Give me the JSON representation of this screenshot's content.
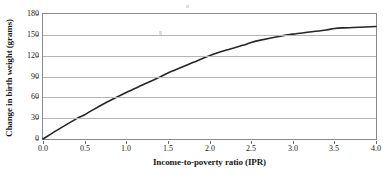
{
  "chart_data": {
    "type": "line",
    "title": "",
    "subtitle": "",
    "xlabel": "Income-to-poverty ratio (IPR)",
    "ylabel": "Change in birth weight (grams)",
    "xlim": [
      0.0,
      4.0
    ],
    "ylim": [
      0,
      180
    ],
    "xticks": [
      "0.0",
      "0.5",
      "1.0",
      "1.5",
      "2.0",
      "2.5",
      "3.0",
      "3.5",
      "4.0"
    ],
    "xtick_values": [
      0.0,
      0.5,
      1.0,
      1.5,
      2.0,
      2.5,
      3.0,
      3.5,
      4.0
    ],
    "yticks": [
      "0",
      "30",
      "60",
      "90",
      "120",
      "150",
      "180"
    ],
    "ytick_values": [
      0,
      30,
      60,
      90,
      120,
      150,
      180
    ],
    "grid": "horizontal",
    "legend": "none",
    "annotations": [],
    "series": [
      {
        "name": "Change in birth weight",
        "color": "#262626",
        "x": [
          0.0,
          0.2,
          0.4,
          0.5,
          0.6,
          0.8,
          1.0,
          1.2,
          1.4,
          1.5,
          1.6,
          1.8,
          2.0,
          2.2,
          2.4,
          2.5,
          2.6,
          2.8,
          3.0,
          3.2,
          3.4,
          3.5,
          3.6,
          3.8,
          4.0
        ],
        "values": [
          0,
          15,
          29,
          35,
          42,
          55,
          67,
          78,
          89,
          95,
          100,
          110,
          120,
          128,
          135,
          139,
          142,
          147,
          151,
          154,
          157,
          159,
          160,
          161,
          162
        ]
      }
    ]
  },
  "axes": {
    "y_title": "Change in birth weight (grams)",
    "x_title": "Income-to-poverty ratio (IPR)"
  }
}
